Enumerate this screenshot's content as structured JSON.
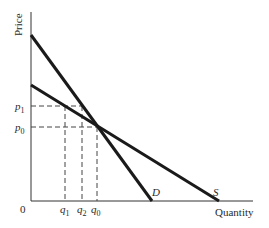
{
  "diagram": {
    "type": "supply-demand",
    "y_axis_label": "Price",
    "x_axis_label": "Quantity",
    "origin_label": "0",
    "curves": [
      {
        "name": "D",
        "label": "D",
        "from": [
          31,
          35
        ],
        "to": [
          152,
          201
        ]
      },
      {
        "name": "S",
        "label": "S",
        "from": [
          31,
          85
        ],
        "to": [
          219,
          201
        ]
      }
    ],
    "price_levels": [
      {
        "base": "p",
        "sub": "1",
        "y": 106
      },
      {
        "base": "p",
        "sub": "0",
        "y": 127
      }
    ],
    "quantity_levels": [
      {
        "base": "q",
        "sub": "1",
        "x": 65
      },
      {
        "base": "q",
        "sub": "2",
        "x": 82
      },
      {
        "base": "q",
        "sub": "0",
        "x": 97
      }
    ],
    "line_color": "#1a1a1a"
  }
}
